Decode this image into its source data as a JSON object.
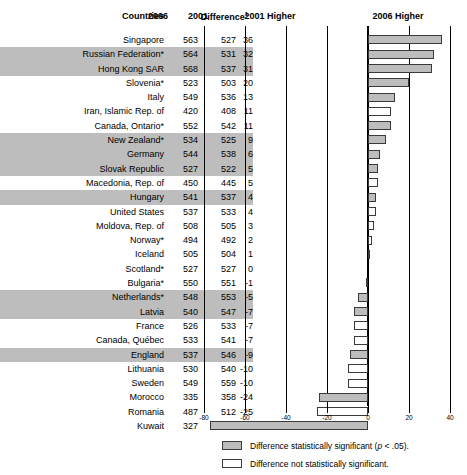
{
  "header": {
    "countries": "Countries",
    "year_2006": "2006",
    "year_2001": "2001",
    "difference": "Difference",
    "difference_note": "1",
    "left_side": "2001 Higher",
    "right_side": "2006 Higher"
  },
  "legend": [
    {
      "label": "Difference statistically significant (p < .05).",
      "fill": "significant"
    },
    {
      "label": "Difference not statistically significant.",
      "fill": "not-significant"
    }
  ],
  "colors": {
    "significant_fill": "#bdbdbd",
    "not_significant_fill": "#ffffff",
    "bar_border": "#3a3a3a",
    "row_shade": "#bdbdbd",
    "axis": "#000000"
  },
  "chart_data": {
    "type": "bar",
    "title": "",
    "xlabel": "",
    "ylabel": "",
    "xlim": [
      -80,
      40
    ],
    "xticks": [
      -80,
      -60,
      -40,
      -20,
      0,
      20,
      40
    ],
    "xticklabels": [
      "-80",
      "-60",
      "-40",
      "-20",
      "0",
      "20",
      "40"
    ],
    "grid": true,
    "orientation": "horizontal",
    "legend_position": "bottom",
    "categories": [
      "Singapore",
      "Russian Federation*",
      "Hong Kong SAR",
      "Slovenia*",
      "Italy",
      "Iran, Islamic Rep. of",
      "Canada, Ontario*",
      "New Zealand*",
      "Germany",
      "Slovak Republic",
      "Macedonia, Rep. of",
      "Hungary",
      "United States",
      "Moldova, Rep. of",
      "Norway*",
      "Iceland",
      "Scotland*",
      "Bulgaria*",
      "Netherlands*",
      "Latvia",
      "France",
      "Canada, Québec",
      "England",
      "Lithuania",
      "Sweden",
      "Morocco",
      "Romania",
      "Kuwait"
    ],
    "values": [
      36,
      32,
      31,
      20,
      13,
      11,
      11,
      9,
      6,
      5,
      5,
      4,
      4,
      3,
      2,
      1,
      0,
      -1,
      -5,
      -7,
      -7,
      -7,
      -9,
      -10,
      -10,
      -24,
      -25,
      -77
    ]
  },
  "rows": [
    {
      "country": "Singapore",
      "v2006": "563",
      "v2001": "527",
      "diff": "36",
      "value": 36,
      "significant": true,
      "row_shaded": false
    },
    {
      "country": "Russian Federation*",
      "v2006": "564",
      "v2001": "531",
      "diff": "32",
      "value": 32,
      "significant": true,
      "row_shaded": true
    },
    {
      "country": "Hong Kong SAR",
      "v2006": "568",
      "v2001": "537",
      "diff": "31",
      "value": 31,
      "significant": true,
      "row_shaded": true
    },
    {
      "country": "Slovenia*",
      "v2006": "523",
      "v2001": "503",
      "diff": "20",
      "value": 20,
      "significant": true,
      "row_shaded": false
    },
    {
      "country": "Italy",
      "v2006": "549",
      "v2001": "536",
      "diff": "13",
      "value": 13,
      "significant": true,
      "row_shaded": false
    },
    {
      "country": "Iran, Islamic Rep. of",
      "v2006": "420",
      "v2001": "408",
      "diff": "11",
      "value": 11,
      "significant": false,
      "row_shaded": false
    },
    {
      "country": "Canada, Ontario*",
      "v2006": "552",
      "v2001": "542",
      "diff": "11",
      "value": 11,
      "significant": true,
      "row_shaded": false
    },
    {
      "country": "New Zealand*",
      "v2006": "534",
      "v2001": "525",
      "diff": "9",
      "value": 9,
      "significant": true,
      "row_shaded": true
    },
    {
      "country": "Germany",
      "v2006": "544",
      "v2001": "538",
      "diff": "6",
      "value": 6,
      "significant": true,
      "row_shaded": true
    },
    {
      "country": "Slovak Republic",
      "v2006": "527",
      "v2001": "522",
      "diff": "5",
      "value": 5,
      "significant": true,
      "row_shaded": true
    },
    {
      "country": "Macedonia, Rep. of",
      "v2006": "450",
      "v2001": "445",
      "diff": "5",
      "value": 5,
      "significant": false,
      "row_shaded": false
    },
    {
      "country": "Hungary",
      "v2006": "541",
      "v2001": "537",
      "diff": "4",
      "value": 4,
      "significant": true,
      "row_shaded": true
    },
    {
      "country": "United States",
      "v2006": "537",
      "v2001": "533",
      "diff": "4",
      "value": 4,
      "significant": false,
      "row_shaded": false
    },
    {
      "country": "Moldova, Rep. of",
      "v2006": "508",
      "v2001": "505",
      "diff": "3",
      "value": 3,
      "significant": false,
      "row_shaded": false
    },
    {
      "country": "Norway*",
      "v2006": "494",
      "v2001": "492",
      "diff": "2",
      "value": 2,
      "significant": false,
      "row_shaded": false
    },
    {
      "country": "Iceland",
      "v2006": "505",
      "v2001": "504",
      "diff": "1",
      "value": 1,
      "significant": false,
      "row_shaded": false
    },
    {
      "country": "Scotland*",
      "v2006": "527",
      "v2001": "527",
      "diff": "0",
      "value": 0,
      "significant": false,
      "row_shaded": false
    },
    {
      "country": "Bulgaria*",
      "v2006": "550",
      "v2001": "551",
      "diff": "-1",
      "value": -1,
      "significant": false,
      "row_shaded": false
    },
    {
      "country": "Netherlands*",
      "v2006": "548",
      "v2001": "553",
      "diff": "-5",
      "value": -5,
      "significant": true,
      "row_shaded": true
    },
    {
      "country": "Latvia",
      "v2006": "540",
      "v2001": "547",
      "diff": "-7",
      "value": -7,
      "significant": true,
      "row_shaded": true
    },
    {
      "country": "France",
      "v2006": "526",
      "v2001": "533",
      "diff": "-7",
      "value": -7,
      "significant": false,
      "row_shaded": false
    },
    {
      "country": "Canada, Québec",
      "v2006": "533",
      "v2001": "541",
      "diff": "-7",
      "value": -7,
      "significant": false,
      "row_shaded": false
    },
    {
      "country": "England",
      "v2006": "537",
      "v2001": "546",
      "diff": "-9",
      "value": -9,
      "significant": true,
      "row_shaded": true
    },
    {
      "country": "Lithuania",
      "v2006": "530",
      "v2001": "540",
      "diff": "-10",
      "value": -10,
      "significant": false,
      "row_shaded": false
    },
    {
      "country": "Sweden",
      "v2006": "549",
      "v2001": "559",
      "diff": "-10",
      "value": -10,
      "significant": false,
      "row_shaded": false
    },
    {
      "country": "Morocco",
      "v2006": "335",
      "v2001": "358",
      "diff": "-24",
      "value": -24,
      "significant": true,
      "row_shaded": false
    },
    {
      "country": "Romania",
      "v2006": "487",
      "v2001": "512",
      "diff": "-25",
      "value": -25,
      "significant": false,
      "row_shaded": false
    },
    {
      "country": "Kuwait",
      "v2006": "327",
      "v2001": "403",
      "diff": "-77",
      "value": -77,
      "significant": true,
      "row_shaded": false
    }
  ]
}
